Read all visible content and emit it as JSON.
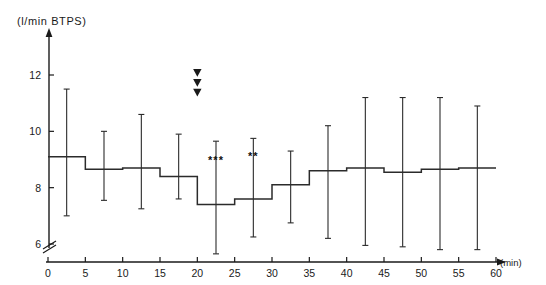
{
  "figure": {
    "title": "",
    "y_axis_title": "(l/min BTPS)",
    "x_axis_unit": "(min)"
  },
  "chart_data": {
    "type": "line",
    "subtype": "step-with-error-bars",
    "title": "",
    "subtitle": "",
    "xlabel": "(min)",
    "ylabel": "(l/min BTPS)",
    "xlim": [
      0,
      60
    ],
    "ylim": [
      5.4,
      12.6
    ],
    "y_axis_break": true,
    "y_axis_break_note": "axis broken below 6",
    "grid": false,
    "legend": false,
    "x_ticks": [
      0,
      5,
      10,
      15,
      20,
      25,
      30,
      35,
      40,
      45,
      50,
      55,
      60
    ],
    "x_tick_labels": [
      "0",
      "5",
      "10",
      "15",
      "20",
      "25",
      "30",
      "35",
      "40",
      "45",
      "50",
      "55",
      "60"
    ],
    "y_ticks": [
      6,
      8,
      10,
      12
    ],
    "y_tick_labels": [
      "6",
      "8",
      "10",
      "12"
    ],
    "step_interval_min": 5,
    "categories": [
      "0-5",
      "5-10",
      "10-15",
      "15-20",
      "20-25",
      "25-30",
      "30-35",
      "35-40",
      "40-45",
      "45-50",
      "50-55",
      "55-60"
    ],
    "x_midpoints": [
      2.5,
      7.5,
      12.5,
      17.5,
      22.5,
      27.5,
      32.5,
      37.5,
      42.5,
      47.5,
      52.5,
      57.5
    ],
    "series": [
      {
        "name": "Ventilation (mean)",
        "values": [
          9.1,
          8.65,
          8.7,
          8.4,
          7.4,
          7.6,
          8.1,
          8.6,
          8.7,
          8.55,
          8.65,
          8.7
        ],
        "error_upper": [
          11.5,
          10.0,
          10.6,
          9.9,
          9.65,
          9.75,
          9.3,
          10.2,
          11.2,
          11.2,
          11.2,
          10.9
        ],
        "error_lower": [
          7.0,
          7.55,
          7.25,
          7.6,
          5.65,
          6.25,
          6.75,
          6.2,
          5.95,
          5.9,
          5.8,
          5.8
        ]
      }
    ],
    "significance_markers": [
      {
        "label": "***",
        "x": 22.5,
        "y": 8.85
      },
      {
        "label": "**",
        "x": 27.5,
        "y": 9.0
      }
    ],
    "annotations": [
      {
        "type": "arrow-down",
        "x": 20,
        "y": 12.05
      },
      {
        "type": "arrow-down",
        "x": 20,
        "y": 11.7
      },
      {
        "type": "arrow-down",
        "x": 20,
        "y": 11.35
      }
    ]
  },
  "colors": {
    "ink": "#1a1a1a",
    "background": "#ffffff",
    "line": "#2b2b2b"
  }
}
